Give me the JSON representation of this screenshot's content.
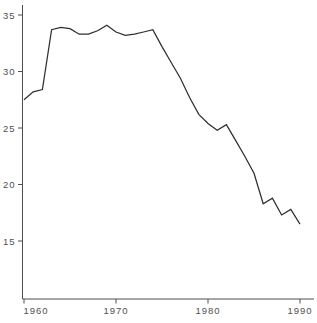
{
  "chart_data": {
    "type": "line",
    "title": "",
    "xlabel": "",
    "ylabel": "",
    "x": [
      1960,
      1961,
      1962,
      1963,
      1964,
      1965,
      1966,
      1967,
      1968,
      1969,
      1970,
      1971,
      1972,
      1973,
      1974,
      1975,
      1976,
      1977,
      1978,
      1979,
      1980,
      1981,
      1982,
      1983,
      1984,
      1985,
      1986,
      1987,
      1988,
      1989,
      1990
    ],
    "values": [
      27.5,
      28.2,
      28.4,
      33.7,
      33.9,
      33.8,
      33.3,
      33.3,
      33.6,
      34.1,
      33.5,
      33.2,
      33.3,
      33.5,
      33.7,
      32.2,
      30.8,
      29.4,
      27.7,
      26.2,
      25.4,
      24.8,
      25.3,
      23.9,
      22.5,
      21.0,
      18.3,
      18.8,
      17.3,
      17.8,
      16.5
    ],
    "x_tick_labels": [
      "1960",
      "1970",
      "1980",
      "1990"
    ],
    "x_tick_years": [
      1960,
      1970,
      1980,
      1990
    ],
    "y_tick_labels": [
      "35",
      "30",
      "25",
      "20",
      "15"
    ],
    "y_tick_values": [
      35,
      30,
      25,
      20,
      15
    ],
    "xlim": [
      1960,
      1990
    ],
    "ylim": [
      10,
      36
    ],
    "grid": "off",
    "legend": "none",
    "colors": {
      "line": "#2f2f2f",
      "axis": "#4f4f4f",
      "tick_text": "#4f4f4f",
      "background": "#ffffff"
    }
  }
}
